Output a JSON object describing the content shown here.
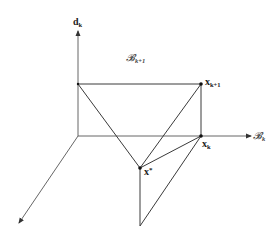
{
  "diagram": {
    "type": "geometric-projection",
    "axes": {
      "vertical": {
        "label": "d",
        "subscript": "k"
      },
      "horizontal": {
        "label": "𝓑",
        "subscript": "k"
      },
      "diagonal": {
        "label": ""
      }
    },
    "region_label": {
      "label": "𝓑",
      "subscript": "k+1"
    },
    "points": [
      {
        "id": "x_k_plus_1",
        "label": "x",
        "subscript": "k+1",
        "superscript": ""
      },
      {
        "id": "x_k",
        "label": "x",
        "subscript": "k",
        "superscript": ""
      },
      {
        "id": "x_star",
        "label": "x",
        "subscript": "",
        "superscript": "*"
      }
    ]
  }
}
